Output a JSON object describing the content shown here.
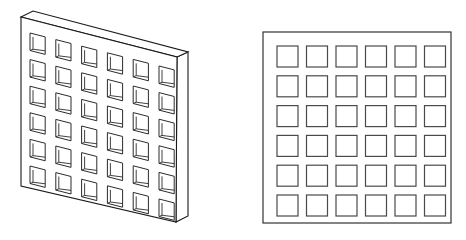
{
  "figure": {
    "title": "Perforated plate — isometric and front orthographic views",
    "background_color": "#ffffff",
    "line_color": "#1a1a1a",
    "hole_line_color": "#4a4a4a",
    "canvas": {
      "width": 466,
      "height": 240
    },
    "views": [
      {
        "id": "isometric",
        "name": "Isometric pictorial view of perforated slab",
        "label": "",
        "grid": {
          "rows": 6,
          "cols": 6,
          "total_holes": 36
        },
        "geometry": {
          "front_face": [
            [
              21,
              17
            ],
            [
              177,
              57
            ],
            [
              176,
              222
            ],
            [
              21,
              186
            ]
          ],
          "top_face": [
            [
              21,
              17
            ],
            [
              33,
              11
            ],
            [
              188,
              52
            ],
            [
              177,
              57
            ]
          ],
          "side_face": [
            [
              177,
              57
            ],
            [
              188,
              52
            ],
            [
              188,
              216
            ],
            [
              176,
              222
            ]
          ],
          "hole_width": 15.2,
          "hole_height": 17.5,
          "hole_step_x": 25.8,
          "hole_step_y": 26.6,
          "hole_origin": [
            30,
            33
          ],
          "column_rise": 6.6,
          "depth_inset": 3.0
        }
      },
      {
        "id": "front-orthographic",
        "name": "Front orthographic view of perforated plate",
        "label": "",
        "grid": {
          "rows": 6,
          "cols": 6,
          "total_holes": 36
        },
        "geometry": {
          "plate": {
            "x": 263,
            "y": 32,
            "width": 188,
            "height": 191
          },
          "hole_size": 21,
          "hole_step_x": 29.5,
          "hole_step_y": 29.8,
          "hole_origin": [
            277,
            46
          ]
        }
      }
    ]
  }
}
